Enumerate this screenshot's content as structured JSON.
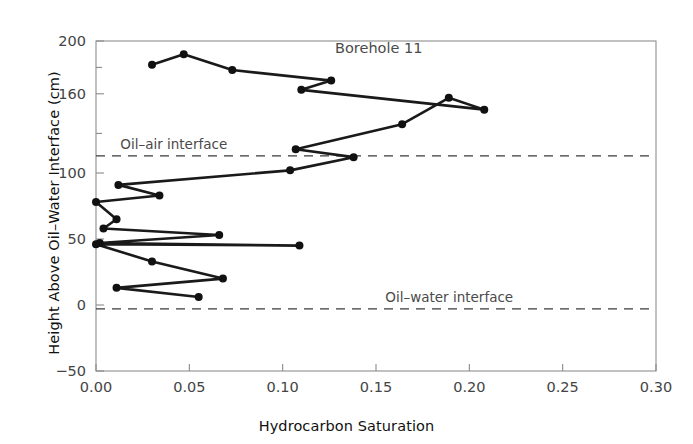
{
  "chart_data": {
    "type": "line",
    "title": "Borehole 11",
    "xlabel": "Hydrocarbon Saturation",
    "ylabel": "Height Above Oil–Water Interface (cm)",
    "xlim": [
      0.0,
      0.3
    ],
    "ylim": [
      -50,
      200
    ],
    "xticks": [
      0.0,
      0.05,
      0.1,
      0.15,
      0.2,
      0.25,
      0.3
    ],
    "xticklabels": [
      "0.00",
      "0.05",
      "0.10",
      "0.15",
      "0.20",
      "0.25",
      "0.30"
    ],
    "yticks": [
      -50,
      0,
      50,
      100,
      160,
      200
    ],
    "yticklabels": [
      "−50",
      "0",
      "50",
      "100",
      "160",
      "200"
    ],
    "y_minor_ticks": [
      130,
      180
    ],
    "grid": false,
    "legend": null,
    "marker": "filled-circle",
    "series": [
      {
        "name": "Borehole 11 saturation profile",
        "x": [
          0.03,
          0.047,
          0.073,
          0.126,
          0.11,
          0.208,
          0.189,
          0.164,
          0.107,
          0.138,
          0.104,
          0.012,
          0.034,
          0.0,
          0.011,
          0.004,
          0.066,
          0.002,
          0.109,
          0.0,
          0.03,
          0.068,
          0.011,
          0.055
        ],
        "y": [
          182,
          190,
          178,
          170,
          163,
          148,
          157,
          137,
          118,
          112,
          102,
          91,
          83,
          78,
          65,
          58,
          53,
          47,
          45,
          46,
          33,
          20,
          13,
          6
        ]
      }
    ],
    "reference_lines": [
      {
        "label": "Oil–air interface",
        "y": 113,
        "style": "dashed",
        "label_x": 0.013
      },
      {
        "label": "Oil–water interface",
        "y": -3,
        "style": "dashed",
        "label_x": 0.155
      }
    ],
    "colors": {
      "line": "#1a1a1a",
      "marker": "#111111",
      "axis": "#8a8a8a",
      "reference_line": "#3b3b3b",
      "text": "#4a4a4a",
      "background": "#ffffff"
    }
  }
}
